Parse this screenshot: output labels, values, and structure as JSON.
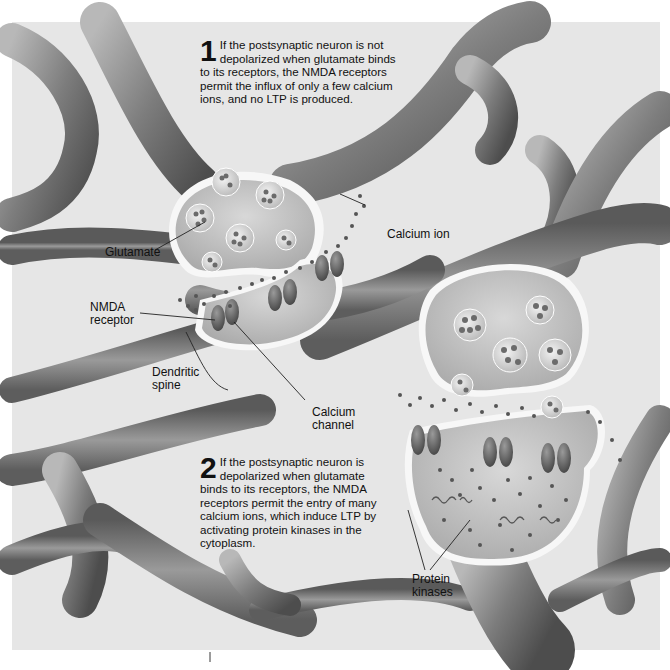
{
  "figure": {
    "background": "#e9e9e9",
    "neuron_color": "#8a8a8a"
  },
  "step1": {
    "number": "1",
    "lines": [
      "If the postsynaptic neuron is not",
      "depolarized when glutamate binds",
      "to its receptors, the NMDA receptors",
      "permit the influx of only a few calcium",
      "ions, and no LTP is produced."
    ]
  },
  "step2": {
    "number": "2",
    "lines": [
      "If the postsynaptic neuron is",
      "depolarized when glutamate",
      "binds to its receptors, the NMDA",
      "receptors permit the entry of many",
      "calcium ions, which induce LTP by",
      "activating protein kinases in the",
      "cytoplasm."
    ]
  },
  "labels": {
    "glutamate": "Glutamate",
    "calcium_ion": "Calcium ion",
    "nmda_receptor": [
      "NMDA",
      "receptor"
    ],
    "dendritic_spine": [
      "Dendritic",
      "spine"
    ],
    "calcium_channel": [
      "Calcium",
      "channel"
    ],
    "protein_kinases": [
      "Protein",
      "kinases"
    ]
  }
}
